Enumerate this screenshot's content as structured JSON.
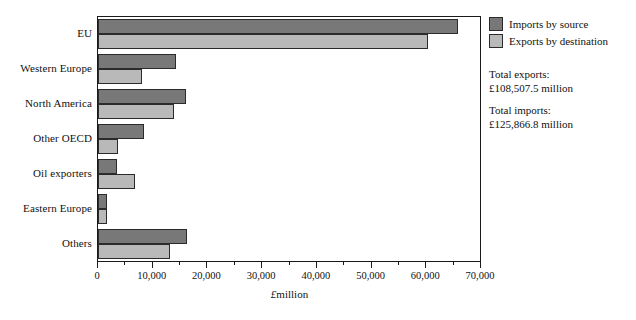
{
  "chart_data": {
    "type": "bar",
    "orientation": "horizontal",
    "title": "",
    "xlabel": "£million",
    "ylabel": "",
    "xlim": [
      0,
      70000
    ],
    "grid": false,
    "legend_position": "right",
    "categories": [
      "EU",
      "Western Europe",
      "North America",
      "Other OECD",
      "Oil exporters",
      "Eastern Europe",
      "Others"
    ],
    "series": [
      {
        "name": "Imports by source",
        "color": "#787878",
        "values": [
          65800,
          14200,
          16000,
          8400,
          3500,
          1600,
          16200
        ]
      },
      {
        "name": "Exports by destination",
        "color": "#b9b9b9",
        "values": [
          60300,
          8000,
          13800,
          3700,
          6800,
          1600,
          13100
        ]
      }
    ],
    "xticks": [
      0,
      10000,
      20000,
      30000,
      40000,
      50000,
      60000,
      70000
    ],
    "xticklabels": [
      "0",
      "10,000",
      "20,000",
      "30,000",
      "40,000",
      "50,000",
      "60,000",
      "70,000"
    ],
    "minor_tick_interval": 5000,
    "annotations": [
      "Total exports:",
      "£108,507.5 million",
      "Total imports:",
      "£125,866.8 million"
    ]
  },
  "legend": {
    "items": [
      {
        "label": "Imports by source",
        "swatch": "imports"
      },
      {
        "label": "Exports by destination",
        "swatch": "exports"
      }
    ]
  },
  "totals": {
    "exports_label": "Total exports:",
    "exports_value": "£108,507.5 million",
    "imports_label": "Total imports:",
    "imports_value": "£125,866.8 million"
  },
  "axis": {
    "x_title": "£million"
  }
}
